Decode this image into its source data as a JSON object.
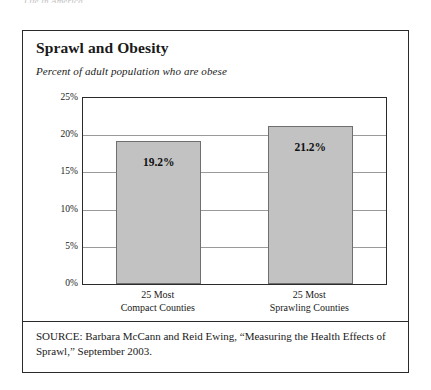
{
  "page": {
    "top_fragment": "Life in America"
  },
  "figure": {
    "title": "Sprawl and Obesity",
    "subtitle": "Percent of adult population who are obese",
    "source_note": "SOURCE: Barbara McCann and Reid Ewing, “Measuring the Health Effects of Sprawl,” September 2003.",
    "colors": {
      "bar_fill": "#c2c2c2",
      "bar_stroke": "#6f6f6f",
      "frame": "#2b2b2b",
      "gridline": "#9a9a9a"
    }
  },
  "chart_data": {
    "type": "bar",
    "title": "Sprawl and Obesity",
    "subtitle": "Percent of adult population who are obese",
    "xlabel": "",
    "ylabel": "",
    "categories": [
      "25 Most Compact Counties",
      "25 Most Sprawling Counties"
    ],
    "category_lines": [
      [
        "25 Most",
        "Compact Counties"
      ],
      [
        "25 Most",
        "Sprawling Counties"
      ]
    ],
    "values": [
      19.2,
      21.2
    ],
    "value_labels": [
      "19.2%",
      "21.2%"
    ],
    "ylim": [
      0,
      25
    ],
    "yticks": [
      0,
      5,
      10,
      15,
      20,
      25
    ],
    "ytick_labels": [
      "0%",
      "5%",
      "10%",
      "15%",
      "20%",
      "25%"
    ],
    "grid": true,
    "legend": false
  }
}
